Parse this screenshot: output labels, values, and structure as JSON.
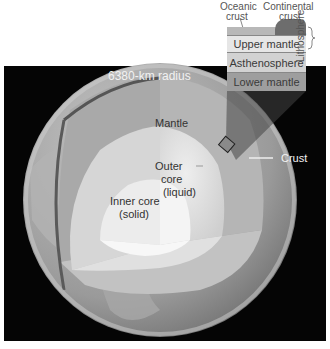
{
  "diagram": {
    "title_label": "6380-km radius",
    "labels": {
      "mantle": "Mantle",
      "outer_core_line1": "Outer",
      "outer_core_line2": "core",
      "outer_core_line3": "(liquid)",
      "inner_core_line1": "Inner core",
      "inner_core_line2": "(solid)",
      "crust": "Crust"
    },
    "inset": {
      "oceanic_crust_line1": "Oceanic",
      "oceanic_crust_line2": "crust",
      "continental_crust_line1": "Continental",
      "continental_crust_line2": "crust",
      "lithosphere": "Lithosphere",
      "layers": [
        "Upper mantle",
        "Asthenosphere",
        "Lower mantle"
      ]
    },
    "colors": {
      "background": "#050505",
      "mantle": "#9a9a9a",
      "outer_core": "#d9d9d9",
      "inner_core": "#f0f0f0",
      "continental_crust": "#6d6d6d"
    }
  }
}
